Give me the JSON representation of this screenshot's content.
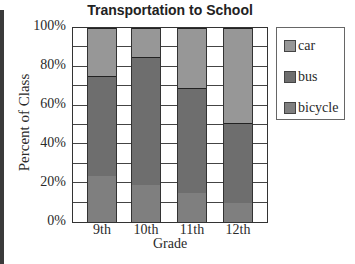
{
  "chart_data": {
    "type": "bar",
    "stacked": true,
    "title": "Transportation to School",
    "xlabel": "Grade",
    "ylabel": "Percent of Class",
    "categories": [
      "9th",
      "10th",
      "11th",
      "12th"
    ],
    "series": [
      {
        "name": "bicycle",
        "values": [
          23.5,
          19,
          15,
          10
        ],
        "color": "#7f7f7f"
      },
      {
        "name": "bus",
        "values": [
          52,
          66,
          54,
          41
        ],
        "color": "#6e6e6e"
      },
      {
        "name": "car",
        "values": [
          24.5,
          15,
          31,
          49
        ],
        "color": "#979797"
      }
    ],
    "yticks": [
      "0%",
      "20%",
      "40%",
      "60%",
      "80%",
      "100%"
    ],
    "ylim": [
      0,
      100
    ],
    "grid": true,
    "grid_step": 10,
    "legend": {
      "position": "right",
      "entries": [
        "car",
        "bus",
        "bicycle"
      ]
    }
  }
}
